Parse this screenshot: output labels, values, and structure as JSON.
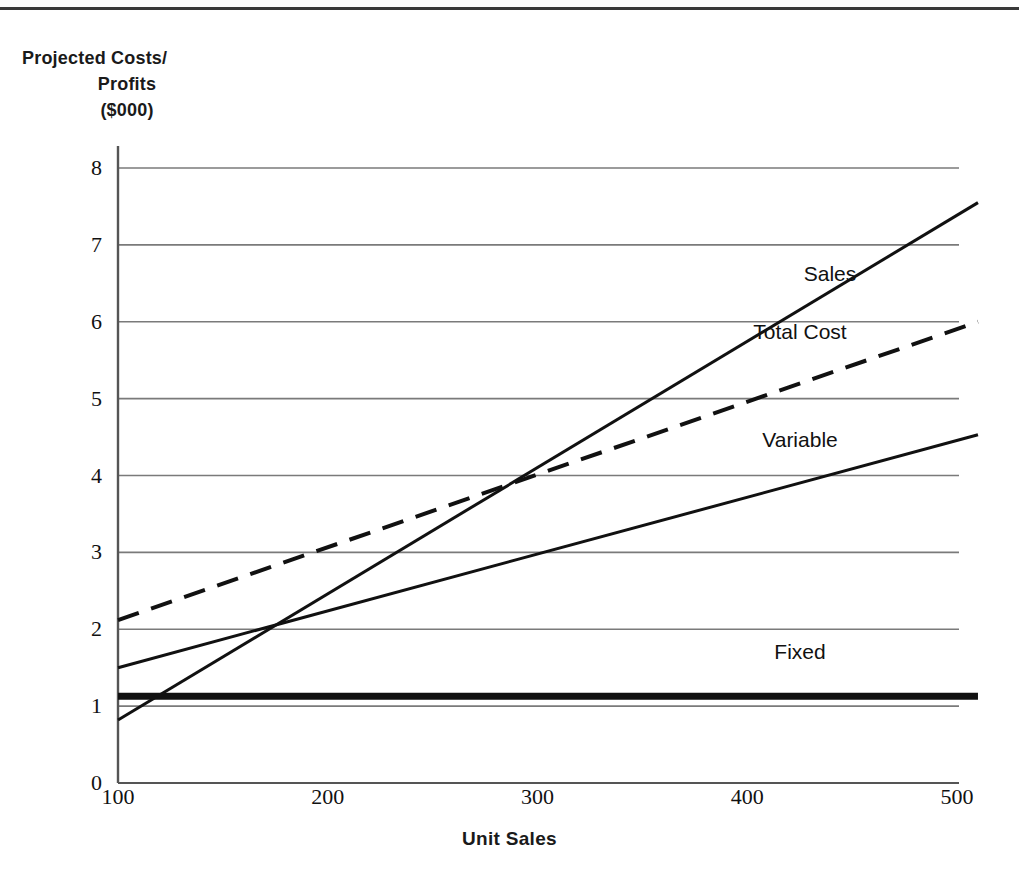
{
  "chart_data": {
    "type": "line",
    "title_lines": [
      "Projected Costs/",
      "Profits",
      "($000)"
    ],
    "xlabel": "Unit Sales",
    "ylabel": "Projected Costs/Profits ($000)",
    "xlim": [
      100,
      510
    ],
    "ylim": [
      0,
      8
    ],
    "xticks": [
      100,
      200,
      300,
      400,
      500
    ],
    "xtick_labels": [
      "100",
      "200",
      "300",
      "400",
      "500"
    ],
    "yticks": [
      0,
      1,
      2,
      3,
      4,
      5,
      6,
      7,
      8
    ],
    "ytick_labels": [
      "0",
      "1",
      "2",
      "3",
      "4",
      "5",
      "6",
      "7",
      "8"
    ],
    "grid": "horizontal",
    "legend": "inline-labels",
    "x": [
      100,
      500
    ],
    "series": [
      {
        "name": "Sales",
        "label": "Sales",
        "style": "solid",
        "width": 3,
        "color": "#111111",
        "values": [
          0.82,
          7.4
        ],
        "x_start": 100,
        "x_end": 510,
        "y_start": 0.82,
        "y_end": 7.55,
        "label_x": 830,
        "label_y": 6.62
      },
      {
        "name": "Total Cost",
        "label": "Total Cost",
        "style": "dashed",
        "width": 4,
        "color": "#111111",
        "values": [
          2.12,
          5.89
        ],
        "x_start": 100,
        "x_end": 510,
        "y_start": 2.12,
        "y_end": 6.0,
        "label_x": 800,
        "label_y": 5.87
      },
      {
        "name": "Variable",
        "label": "Variable",
        "style": "solid",
        "width": 3,
        "color": "#111111",
        "values": [
          1.5,
          4.44
        ],
        "x_start": 100,
        "x_end": 510,
        "y_start": 1.5,
        "y_end": 4.53,
        "label_x": 800,
        "label_y": 4.46
      },
      {
        "name": "Fixed",
        "label": "Fixed",
        "style": "solid-thick",
        "width": 7,
        "color": "#111111",
        "values": [
          1.13,
          1.13
        ],
        "x_start": 100,
        "x_end": 510,
        "y_start": 1.13,
        "y_end": 1.13,
        "label_x": 800,
        "label_y": 1.7
      }
    ],
    "axis_color": "#555555",
    "grid_color": "#7a7a7a",
    "background": "#ffffff"
  },
  "layout": {
    "plot_left_px": 118,
    "plot_right_px": 957,
    "plot_top_px": 168,
    "plot_bottom_px": 783
  }
}
